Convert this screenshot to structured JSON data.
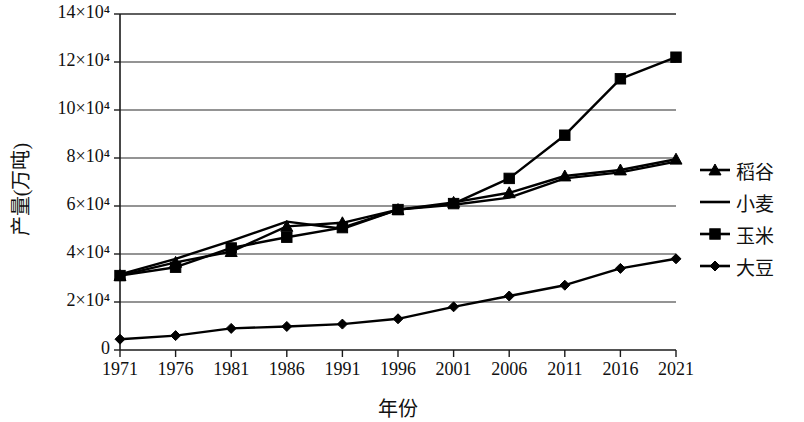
{
  "chart_data": {
    "type": "line",
    "title": "",
    "xlabel": "年份",
    "ylabel": "产量(万吨)",
    "categories": [
      "1971",
      "1976",
      "1981",
      "1986",
      "1991",
      "1996",
      "2001",
      "2006",
      "2011",
      "2016",
      "2021"
    ],
    "xlim": [
      1971,
      2021
    ],
    "ylim": [
      0,
      140000
    ],
    "ytick_labels": [
      "0",
      "2×10⁴",
      "4×10⁴",
      "6×10⁴",
      "8×10⁴",
      "10×10⁴",
      "12×10⁴",
      "14×10⁴"
    ],
    "ytick_values": [
      0,
      20000,
      40000,
      60000,
      80000,
      100000,
      120000,
      140000
    ],
    "grid": "horizontal",
    "legend_position": "right",
    "series": [
      {
        "name": "稻谷",
        "marker": "triangle",
        "values": [
          31000,
          36500,
          41000,
          51500,
          53000,
          58500,
          61500,
          65500,
          72500,
          75000,
          79500
        ]
      },
      {
        "name": "小麦",
        "marker": "none",
        "values": [
          31500,
          38000,
          45500,
          53500,
          50500,
          58500,
          60500,
          63500,
          71500,
          74000,
          78500
        ]
      },
      {
        "name": "玉米",
        "marker": "square",
        "values": [
          31000,
          34500,
          42500,
          47000,
          51000,
          58500,
          61000,
          71500,
          89500,
          113000,
          122000
        ]
      },
      {
        "name": "大豆",
        "marker": "diamond",
        "values": [
          4500,
          6000,
          9000,
          9800,
          10800,
          13000,
          18000,
          22500,
          27000,
          34000,
          38000
        ]
      }
    ]
  },
  "legend": {
    "items": [
      {
        "label": "稻谷",
        "marker": "triangle"
      },
      {
        "label": "小麦",
        "marker": "none"
      },
      {
        "label": "玉米",
        "marker": "square"
      },
      {
        "label": "大豆",
        "marker": "diamond"
      }
    ]
  },
  "colors": {
    "line": "#000000",
    "grid": "#2a2a2a",
    "axis": "#1a1a1a",
    "background": "#ffffff"
  }
}
